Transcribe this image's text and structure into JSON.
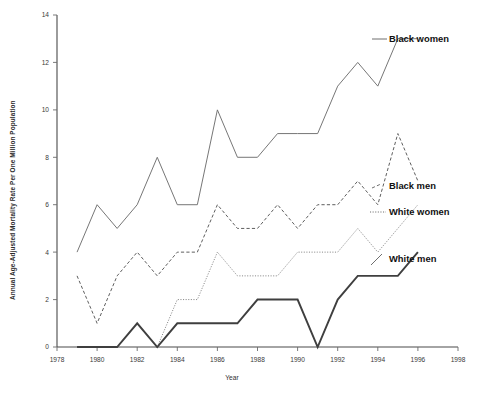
{
  "chart_data": {
    "type": "line",
    "title": "",
    "xlabel": "Year",
    "ylabel": "Annual Age-Adjusted Mortality Rate Per One Million Population",
    "xlim": [
      1978,
      1998
    ],
    "ylim": [
      0,
      14
    ],
    "xticks": [
      1978,
      1980,
      1982,
      1984,
      1986,
      1988,
      1990,
      1992,
      1994,
      1996,
      1998
    ],
    "yticks": [
      0,
      2,
      4,
      6,
      8,
      10,
      12,
      14
    ],
    "grid": false,
    "legend_position": "right-inline",
    "x": [
      1979,
      1980,
      1981,
      1982,
      1983,
      1984,
      1985,
      1986,
      1987,
      1988,
      1989,
      1990,
      1991,
      1992,
      1993,
      1994,
      1995,
      1996
    ],
    "series": [
      {
        "name": "Black women",
        "style": "solid-thin",
        "color": "#6f6f6f",
        "values": [
          4,
          6,
          5,
          6,
          8,
          6,
          6,
          10,
          8,
          8,
          9,
          9,
          9,
          11,
          12,
          11,
          13,
          13
        ]
      },
      {
        "name": "Black men",
        "style": "dashed",
        "color": "#5e5e5e",
        "values": [
          3,
          1,
          3,
          4,
          3,
          4,
          4,
          6,
          5,
          5,
          6,
          5,
          6,
          6,
          7,
          6,
          9,
          7
        ]
      },
      {
        "name": "White women",
        "style": "dotted",
        "color": "#8a8a8a",
        "values": [
          null,
          null,
          null,
          null,
          0,
          2,
          2,
          4,
          3,
          3,
          3,
          4,
          4,
          4,
          5,
          4,
          5,
          6
        ]
      },
      {
        "name": "White men",
        "style": "solid-thick",
        "color": "#3f3f3f",
        "values": [
          0,
          0,
          0,
          1,
          0,
          1,
          1,
          1,
          1,
          2,
          2,
          2,
          0,
          2,
          3,
          3,
          3,
          4
        ]
      }
    ]
  },
  "axes": {
    "y_title": "Annual Age-Adjusted Mortality Rate Per One Million Population",
    "x_title": "Year",
    "y_tick_labels": [
      "0",
      "2",
      "4",
      "6",
      "8",
      "10",
      "12",
      "14"
    ],
    "x_tick_labels": [
      "1978",
      "1980",
      "1982",
      "1984",
      "1986",
      "1988",
      "1990",
      "1992",
      "1994",
      "1996",
      "1998"
    ]
  },
  "legend": {
    "items": [
      {
        "label": "Black women"
      },
      {
        "label": "Black men"
      },
      {
        "label": "White women"
      },
      {
        "label": "White men"
      }
    ]
  }
}
